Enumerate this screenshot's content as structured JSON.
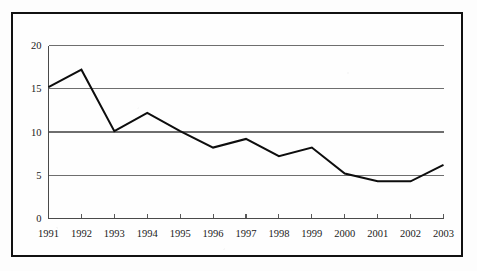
{
  "chart_data": {
    "type": "line",
    "title": "",
    "subtitle": "",
    "xlabel": "",
    "ylabel": "",
    "categories": [
      "1991",
      "1992",
      "1993",
      "1994",
      "1995",
      "1996",
      "1997",
      "1998",
      "1999",
      "2000",
      "2001",
      "2002",
      "2003"
    ],
    "values": [
      15.2,
      17.2,
      10.1,
      12.2,
      10.1,
      8.2,
      9.2,
      7.2,
      8.2,
      5.2,
      4.3,
      4.3,
      6.2
    ],
    "series": [
      {
        "name": "",
        "values": [
          15.2,
          17.2,
          10.1,
          12.2,
          10.1,
          8.2,
          9.2,
          7.2,
          8.2,
          5.2,
          4.3,
          4.3,
          6.2
        ]
      }
    ],
    "x_tick_labels": [
      "1991",
      "1992",
      "1993",
      "1994",
      "1995",
      "1996",
      "1997",
      "1998",
      "1999",
      "2000",
      "2001",
      "2002",
      "2003"
    ],
    "y_tick_labels": [
      "0",
      "5",
      "10",
      "15",
      "20"
    ],
    "y_tick_values": [
      0,
      5,
      10,
      15,
      20
    ],
    "ylim": [
      0,
      20
    ],
    "xlim": [
      "1991",
      "2003"
    ],
    "grid": "horizontal",
    "legend": "none",
    "annotations": [],
    "colors": {
      "line": "#0d0d0d",
      "grid": "#6e6e6e",
      "axis": "#4a4a4a",
      "text": "#1a1a1a",
      "frame": "#111111",
      "background": "#fefefe"
    }
  },
  "figure": {
    "frame_present": true,
    "caption": ""
  }
}
